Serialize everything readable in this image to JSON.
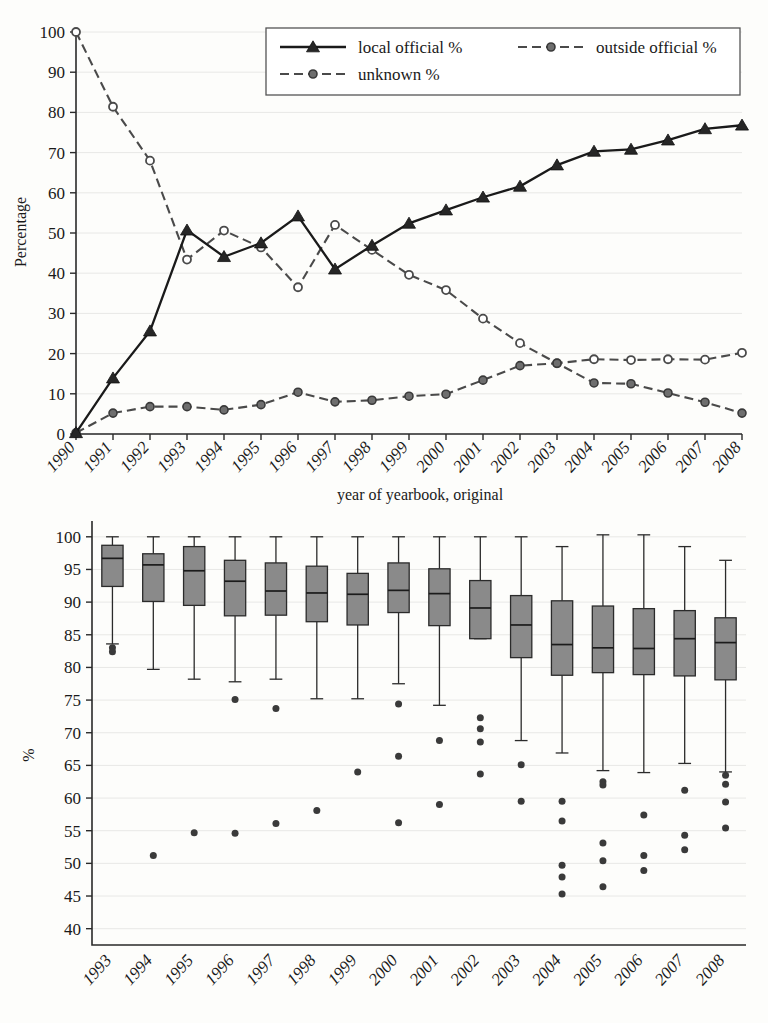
{
  "chart_data": [
    {
      "type": "line",
      "panel": "top",
      "title": "",
      "xlabel": "year of yearbook, original",
      "ylabel": "Percentage",
      "ylim": [
        0,
        100
      ],
      "yticks": [
        0,
        10,
        20,
        30,
        40,
        50,
        60,
        70,
        80,
        90,
        100
      ],
      "grid": true,
      "legend_position": "top-center",
      "categories": [
        "1990",
        "1991",
        "1992",
        "1993",
        "1994",
        "1995",
        "1996",
        "1997",
        "1998",
        "1999",
        "2000",
        "2001",
        "2002",
        "2003",
        "2004",
        "2005",
        "2006",
        "2007",
        "2008"
      ],
      "series": [
        {
          "name": "local official %",
          "style": "solid",
          "marker": "triangle",
          "color": "#1a1a1a",
          "values": [
            0.3,
            13.9,
            25.6,
            50.7,
            44.1,
            47.5,
            54.2,
            41.0,
            46.9,
            52.4,
            55.7,
            58.9,
            61.6,
            66.9,
            70.3,
            70.8,
            73.1,
            75.9,
            76.8
          ]
        },
        {
          "name": "outside official %",
          "style": "dashed",
          "marker": "circle",
          "color": "#4a4a4a",
          "values": [
            0.3,
            5.2,
            6.8,
            6.8,
            6.0,
            7.3,
            10.4,
            8.0,
            8.4,
            9.4,
            9.9,
            13.4,
            17.0,
            17.6,
            12.7,
            12.5,
            10.2,
            7.9,
            5.2
          ]
        },
        {
          "name": "unknown %",
          "style": "dashed",
          "marker": "circle",
          "color": "#4a4a4a",
          "values": [
            100.0,
            81.4,
            68.0,
            43.4,
            50.6,
            46.4,
            36.5,
            52.0,
            45.8,
            39.6,
            35.8,
            28.7,
            22.6,
            17.6,
            18.6,
            18.4,
            18.6,
            18.5,
            20.2
          ]
        }
      ]
    },
    {
      "type": "box",
      "panel": "bottom",
      "title": "",
      "xlabel": "",
      "ylabel": "%",
      "ylim": [
        37.5,
        101.5
      ],
      "yticks": [
        40,
        45,
        50,
        55,
        60,
        65,
        70,
        75,
        80,
        85,
        90,
        95,
        100
      ],
      "grid": true,
      "box_fill": "#8a8a8a",
      "categories": [
        "1993",
        "1994",
        "1995",
        "1996",
        "1997",
        "1998",
        "1999",
        "2000",
        "2001",
        "2002",
        "2003",
        "2004",
        "2005",
        "2006",
        "2007",
        "2008"
      ],
      "boxes": [
        {
          "year": "1993",
          "whisker_low": 83.6,
          "q1": 92.4,
          "median": 96.7,
          "q3": 98.7,
          "whisker_high": 100.0,
          "outliers": [
            83.0,
            82.4
          ]
        },
        {
          "year": "1994",
          "whisker_low": 79.7,
          "q1": 90.1,
          "median": 95.7,
          "q3": 97.4,
          "whisker_high": 100.0,
          "outliers": [
            51.2
          ]
        },
        {
          "year": "1995",
          "whisker_low": 78.2,
          "q1": 89.5,
          "median": 94.8,
          "q3": 98.5,
          "whisker_high": 100.0,
          "outliers": [
            54.7
          ]
        },
        {
          "year": "1996",
          "whisker_low": 77.8,
          "q1": 87.9,
          "median": 93.2,
          "q3": 96.4,
          "whisker_high": 100.0,
          "outliers": [
            75.1,
            54.6
          ]
        },
        {
          "year": "1997",
          "whisker_low": 78.2,
          "q1": 88.0,
          "median": 91.7,
          "q3": 96.0,
          "whisker_high": 100.0,
          "outliers": [
            73.7,
            56.1
          ]
        },
        {
          "year": "1998",
          "whisker_low": 75.2,
          "q1": 87.0,
          "median": 91.4,
          "q3": 95.5,
          "whisker_high": 100.0,
          "outliers": [
            58.1
          ]
        },
        {
          "year": "1999",
          "whisker_low": 75.2,
          "q1": 86.5,
          "median": 91.2,
          "q3": 94.4,
          "whisker_high": 100.0,
          "outliers": [
            64.0
          ]
        },
        {
          "year": "2000",
          "whisker_low": 77.5,
          "q1": 88.4,
          "median": 91.8,
          "q3": 96.0,
          "whisker_high": 100.0,
          "outliers": [
            74.4,
            66.4,
            56.2
          ]
        },
        {
          "year": "2001",
          "whisker_low": 74.2,
          "q1": 86.4,
          "median": 91.3,
          "q3": 95.1,
          "whisker_high": 100.0,
          "outliers": [
            68.8,
            59.0
          ]
        },
        {
          "year": "2002",
          "whisker_low": 84.4,
          "q1": 84.4,
          "median": 89.1,
          "q3": 93.3,
          "whisker_high": 100.0,
          "outliers": [
            72.3,
            70.6,
            68.6,
            63.7
          ]
        },
        {
          "year": "2003",
          "whisker_low": 68.8,
          "q1": 81.5,
          "median": 86.5,
          "q3": 91.0,
          "whisker_high": 100.0,
          "outliers": [
            65.1,
            59.5
          ]
        },
        {
          "year": "2004",
          "whisker_low": 66.9,
          "q1": 78.8,
          "median": 83.5,
          "q3": 90.2,
          "whisker_high": 98.5,
          "outliers": [
            59.5,
            56.5,
            49.7,
            47.9,
            45.3
          ]
        },
        {
          "year": "2005",
          "whisker_low": 64.2,
          "q1": 79.2,
          "median": 83.0,
          "q3": 89.4,
          "whisker_high": 100.3,
          "outliers": [
            62.5,
            62.0,
            53.1,
            50.4,
            46.4
          ]
        },
        {
          "year": "2006",
          "whisker_low": 63.9,
          "q1": 78.9,
          "median": 82.9,
          "q3": 89.0,
          "whisker_high": 100.3,
          "outliers": [
            57.4,
            51.2,
            48.9
          ]
        },
        {
          "year": "2007",
          "whisker_low": 65.3,
          "q1": 78.7,
          "median": 84.4,
          "q3": 88.7,
          "whisker_high": 98.5,
          "outliers": [
            61.2,
            54.3,
            52.1
          ]
        },
        {
          "year": "2008",
          "whisker_low": 64.0,
          "q1": 78.1,
          "median": 83.8,
          "q3": 87.6,
          "whisker_high": 96.4,
          "outliers": [
            63.5,
            62.1,
            59.4,
            55.4
          ]
        }
      ]
    }
  ],
  "top_chart": {
    "ylabel": "Percentage",
    "xlabel": "year of yearbook, original",
    "yticks": [
      "100",
      "90",
      "80",
      "70",
      "60",
      "50",
      "40",
      "30",
      "20",
      "10",
      "0"
    ],
    "xticks": [
      "1990",
      "1991",
      "1992",
      "1993",
      "1994",
      "1995",
      "1996",
      "1997",
      "1998",
      "1999",
      "2000",
      "2001",
      "2002",
      "2003",
      "2004",
      "2005",
      "2006",
      "2007",
      "2008"
    ],
    "legend": {
      "items": [
        {
          "label": "local official %",
          "style": "solid",
          "marker": "triangle"
        },
        {
          "label": "outside official %",
          "style": "dashed",
          "marker": "circle"
        },
        {
          "label": "unknown %",
          "style": "dashed",
          "marker": "circle"
        }
      ]
    }
  },
  "bottom_chart": {
    "ylabel": "%",
    "yticks": [
      "100",
      "95",
      "90",
      "85",
      "80",
      "75",
      "70",
      "65",
      "60",
      "55",
      "50",
      "45",
      "40"
    ],
    "xticks": [
      "1993",
      "1994",
      "1995",
      "1996",
      "1997",
      "1998",
      "1999",
      "2000",
      "2001",
      "2002",
      "2003",
      "2004",
      "2005",
      "2006",
      "2007",
      "2008"
    ]
  }
}
